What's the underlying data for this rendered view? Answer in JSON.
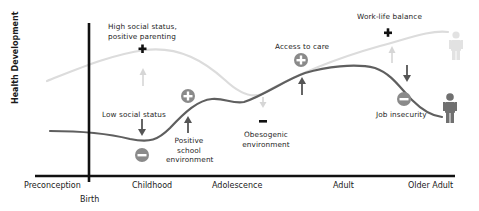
{
  "diagram": {
    "y_axis_label": "Health Development",
    "x_axis": {
      "ticks": [
        "Preconception",
        "Birth",
        "Childhood",
        "Adolescence",
        "Adult",
        "Older Adult"
      ]
    },
    "curves": [
      {
        "name": "optimal-trajectory",
        "style": "light gray",
        "color": "#d9d9d9"
      },
      {
        "name": "actual-trajectory",
        "style": "dark gray",
        "color": "#666666"
      }
    ],
    "factors": [
      {
        "label": "High social status,\npositive parenting",
        "line1": "High social status,",
        "line2": "positive parenting",
        "effect": "positive",
        "symbol": "+",
        "curve": "optimal"
      },
      {
        "label": "Low social status",
        "effect": "negative",
        "symbol": "−",
        "curve": "actual"
      },
      {
        "label": "Positive school environment",
        "line1": "Positive",
        "line2": "school",
        "line3": "environment",
        "effect": "positive",
        "symbol": "+",
        "curve": "actual"
      },
      {
        "label": "Obesogenic environment",
        "line1": "Obesogenic",
        "line2": "environment",
        "effect": "negative",
        "symbol": "−",
        "curve": "optimal"
      },
      {
        "label": "Access to care",
        "effect": "positive",
        "symbol": "+",
        "curve": "actual"
      },
      {
        "label": "Work-life balance",
        "effect": "positive",
        "symbol": "+",
        "curve": "optimal"
      },
      {
        "label": "Job insecurity",
        "effect": "negative",
        "symbol": "−",
        "curve": "actual"
      }
    ],
    "colors": {
      "axis": "#111111",
      "optimal_curve": "#dcdcdc",
      "actual_curve": "#5f5f5f",
      "icon_circle": "#8a8a8a",
      "faded_arrow": "#d6d6d6",
      "dark_arrow": "#555555"
    }
  }
}
